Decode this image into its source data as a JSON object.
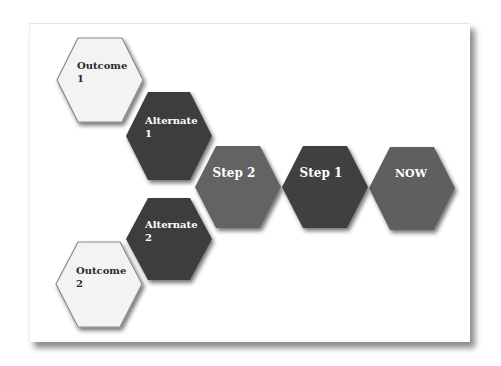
{
  "diagram": {
    "type": "hexagon-flow",
    "colors": {
      "outcome_fill": "#f3f3f3",
      "outcome_stroke": "#8a8a8a",
      "outcome_text": "#2a2a2a",
      "alternate_fill": "#3d3d3d",
      "step2_fill": "#646464",
      "step1_fill": "#3f3f3f",
      "now_fill": "#5e5e5e",
      "light_text": "#ffffff"
    },
    "nodes": [
      {
        "id": "outcome-1",
        "line1": "Outcome",
        "line2": "1"
      },
      {
        "id": "alternate-1",
        "line1": "Alternate",
        "line2": "1"
      },
      {
        "id": "step-2",
        "line1": "Step 2"
      },
      {
        "id": "step-1",
        "line1": "Step 1"
      },
      {
        "id": "now",
        "line1": "NOW"
      },
      {
        "id": "alternate-2",
        "line1": "Alternate",
        "line2": "2"
      },
      {
        "id": "outcome-2",
        "line1": "Outcome",
        "line2": "2"
      }
    ]
  }
}
